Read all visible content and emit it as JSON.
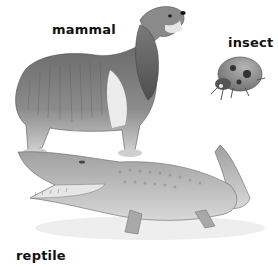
{
  "labels": {
    "mammal": "mammal",
    "insect": "insect",
    "reptile": "reptile"
  },
  "animals": [
    {
      "name": "dog",
      "category": "mammal"
    },
    {
      "name": "ladybug",
      "category": "insect"
    },
    {
      "name": "crocodile",
      "category": "reptile"
    }
  ],
  "colors": {
    "background": "#ffffff",
    "text": "#111111"
  }
}
